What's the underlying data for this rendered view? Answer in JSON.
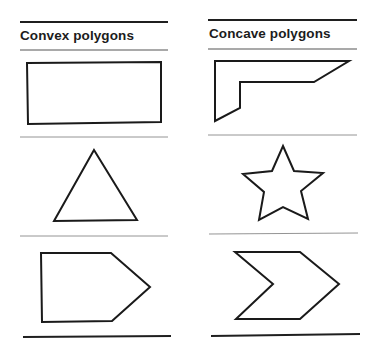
{
  "columns": [
    {
      "title": "Convex polygons",
      "shapes": [
        "rectangle",
        "triangle",
        "pentagon"
      ]
    },
    {
      "title": "Concave polygons",
      "shapes": [
        "l-shaped polygon",
        "star",
        "chevron"
      ]
    }
  ],
  "colors": {
    "stroke": "#1a1a1a",
    "rule": "#2a2a2a",
    "thin_rule": "#8a8a8a",
    "background": "#ffffff"
  }
}
